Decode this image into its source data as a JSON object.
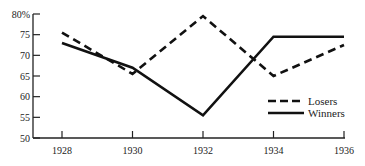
{
  "chart_data": {
    "type": "line",
    "title": "",
    "xlabel": "",
    "ylabel": "",
    "x": [
      1928,
      1930,
      1932,
      1934,
      1936
    ],
    "x_tick_labels": [
      "1928",
      "1930",
      "1932",
      "1934",
      "1936"
    ],
    "y_tick_labels": [
      "80%",
      "75",
      "70",
      "65",
      "60",
      "55",
      "50"
    ],
    "y_ticks": [
      80,
      75,
      70,
      65,
      60,
      55,
      50
    ],
    "ylim": [
      50,
      80
    ],
    "grid": false,
    "legend_position": "lower right",
    "series": [
      {
        "name": "Losers",
        "style": "dashed",
        "color": "#111111",
        "values": [
          75.5,
          65.5,
          79.5,
          65,
          72.5
        ]
      },
      {
        "name": "Winners",
        "style": "solid",
        "color": "#111111",
        "values": [
          73,
          67,
          55.5,
          74.5,
          74.5
        ]
      }
    ]
  },
  "legend": {
    "items": [
      {
        "label": "Losers",
        "style": "dashed"
      },
      {
        "label": "Winners",
        "style": "solid"
      }
    ]
  }
}
